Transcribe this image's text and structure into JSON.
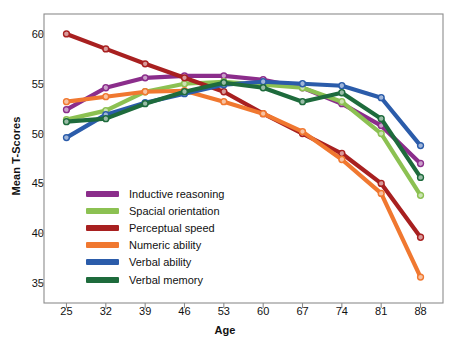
{
  "chart_data": {
    "type": "line",
    "title": "",
    "xlabel": "Age",
    "ylabel": "Mean T-Scores",
    "x": [
      25,
      32,
      39,
      46,
      53,
      60,
      67,
      74,
      81,
      88
    ],
    "xtick_labels": [
      "25",
      "32",
      "39",
      "46",
      "53",
      "60",
      "67",
      "74",
      "81",
      "88"
    ],
    "ytick_labels": [
      "60",
      "55",
      "50",
      "45",
      "40",
      "35"
    ],
    "ytick_values": [
      60,
      55,
      50,
      45,
      40,
      35
    ],
    "ylim": [
      33,
      62
    ],
    "xlim": [
      21,
      92
    ],
    "grid": false,
    "legend_position": "lower-left-inside",
    "markers": "open-circle",
    "series": [
      {
        "name": "Inductive reasoning",
        "color": "#8B2D8B",
        "values": [
          52.4,
          54.6,
          55.6,
          55.8,
          55.8,
          55.4,
          54.6,
          53.0,
          50.8,
          47.0
        ]
      },
      {
        "name": "Spacial orientation",
        "color": "#8CC152",
        "values": [
          51.4,
          52.3,
          54.2,
          55.0,
          55.2,
          54.9,
          54.6,
          53.2,
          50.0,
          43.8
        ]
      },
      {
        "name": "Perceptual speed",
        "color": "#A82020",
        "values": [
          60.0,
          58.5,
          57.0,
          55.6,
          54.2,
          52.0,
          50.0,
          48.0,
          45.0,
          39.6
        ]
      },
      {
        "name": "Numeric ability",
        "color": "#F07830",
        "values": [
          53.2,
          53.7,
          54.2,
          54.3,
          53.2,
          52.0,
          50.2,
          47.4,
          44.0,
          35.6
        ]
      },
      {
        "name": "Verbal ability",
        "color": "#2B5CAA",
        "values": [
          49.6,
          51.9,
          53.1,
          54.0,
          54.9,
          55.2,
          55.0,
          54.8,
          53.6,
          48.8
        ]
      },
      {
        "name": "Verbal memory",
        "color": "#1E6B3C",
        "values": [
          51.2,
          51.5,
          53.0,
          54.2,
          55.1,
          54.6,
          53.2,
          54.1,
          51.5,
          45.6
        ]
      }
    ]
  },
  "axes": {
    "ylabel_text": "Mean T-Scores",
    "xlabel_text": "Age"
  },
  "legend": {
    "items": [
      {
        "label": "Inductive reasoning",
        "color": "#8B2D8B"
      },
      {
        "label": "Spacial orientation",
        "color": "#8CC152"
      },
      {
        "label": "Perceptual speed",
        "color": "#A82020"
      },
      {
        "label": "Numeric ability",
        "color": "#F07830"
      },
      {
        "label": "Verbal ability",
        "color": "#2B5CAA"
      },
      {
        "label": "Verbal memory",
        "color": "#1E6B3C"
      }
    ]
  }
}
